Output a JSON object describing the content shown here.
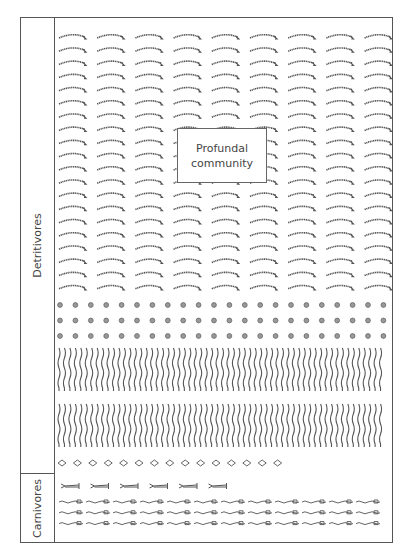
{
  "title": "Profundal community",
  "callout": {
    "line1": "Profundal",
    "line2": "community"
  },
  "sections": {
    "detritivores": {
      "label": "Detritivores"
    },
    "carnivores": {
      "label": "Carnivores"
    }
  },
  "organism_groups": [
    {
      "group": "detritivores",
      "shape": "curved-worm",
      "rows": 20,
      "columns": 9
    },
    {
      "group": "detritivores",
      "shape": "small-circle",
      "rows": 3,
      "columns": 22
    },
    {
      "group": "detritivores",
      "shape": "wavy-line",
      "rows": 2,
      "columns": 60
    },
    {
      "group": "detritivores",
      "shape": "diamond",
      "rows": 1,
      "columns": 15
    },
    {
      "group": "carnivores",
      "shape": "fish-larva",
      "rows": 1,
      "columns": 6
    },
    {
      "group": "carnivores",
      "shape": "small-fish-chain",
      "rows": 3,
      "columns": 12
    }
  ],
  "colors": {
    "stroke": "#555555",
    "text": "#444444",
    "background": "#ffffff"
  }
}
